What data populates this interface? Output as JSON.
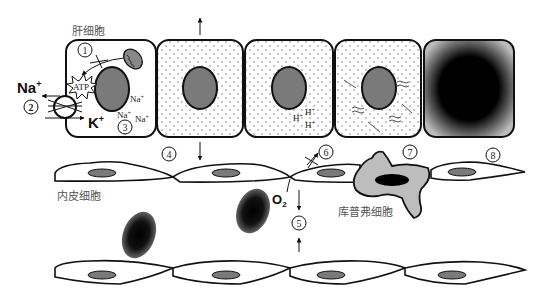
{
  "labels": {
    "hepatocyte": "肝细胞",
    "endothelial": "内皮细胞",
    "kupffer": "库普弗细胞",
    "na_ion": "Na",
    "k_ion": "K",
    "plus": "+",
    "atp": "ATP",
    "o2": "O",
    "o2_sub": "2",
    "na_small": "Na",
    "h_small": "H"
  },
  "markers": [
    "1",
    "2",
    "3",
    "4",
    "5",
    "6",
    "7",
    "8"
  ],
  "colors": {
    "nucleus": "#7a7a7a",
    "kupffer": "#bdbdbd",
    "outline": "#111111",
    "dots": "#555555",
    "necrotic": "#000000"
  }
}
